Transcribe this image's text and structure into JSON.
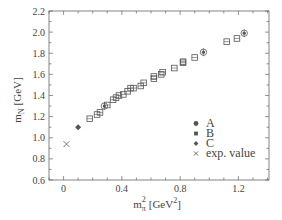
{
  "chart_data": {
    "type": "scatter",
    "title": "",
    "xlabel": "m_π² [GeV²]",
    "ylabel": "m_N [GeV]",
    "xlim": [
      -0.1,
      1.41
    ],
    "ylim": [
      0.6,
      2.2
    ],
    "x_ticks_major": [
      0,
      0.4,
      0.8,
      1.2
    ],
    "x_tick_labels": [
      "0",
      "0.4",
      "0.8",
      "1.2"
    ],
    "x_tick_minor_step": 0.1,
    "y_ticks_major": [
      0.6,
      0.8,
      1.0,
      1.2,
      1.4,
      1.6,
      1.8,
      2.0,
      2.2
    ],
    "y_tick_labels": [
      "0.6",
      "0.8",
      "1.0",
      "1.2",
      "1.4",
      "1.6",
      "1.8",
      "2.0",
      "2.2"
    ],
    "y_tick_minor_step": 0.1,
    "grid": false,
    "legend_position": "lower right",
    "series": [
      {
        "name": "A",
        "marker": "circle",
        "points": [
          [
            0.28,
            1.3
          ],
          [
            0.96,
            1.81
          ],
          [
            1.24,
            1.99
          ]
        ]
      },
      {
        "name": "B",
        "marker": "square",
        "points": [
          [
            0.18,
            1.18
          ],
          [
            0.23,
            1.22
          ],
          [
            0.25,
            1.24
          ],
          [
            0.3,
            1.31
          ],
          [
            0.34,
            1.36
          ],
          [
            0.36,
            1.38
          ],
          [
            0.38,
            1.4
          ],
          [
            0.41,
            1.41
          ],
          [
            0.44,
            1.44
          ],
          [
            0.46,
            1.47
          ],
          [
            0.48,
            1.47
          ],
          [
            0.53,
            1.49
          ],
          [
            0.55,
            1.52
          ],
          [
            0.62,
            1.58
          ],
          [
            0.62,
            1.56
          ],
          [
            0.67,
            1.6
          ],
          [
            0.68,
            1.62
          ],
          [
            0.76,
            1.66
          ],
          [
            0.82,
            1.72
          ],
          [
            0.82,
            1.71
          ],
          [
            0.9,
            1.76
          ],
          [
            1.12,
            1.91
          ],
          [
            1.19,
            1.94
          ]
        ]
      },
      {
        "name": "C",
        "marker": "diamond",
        "points": [
          [
            0.1,
            1.1
          ]
        ]
      },
      {
        "name": "exp. value",
        "marker": "x",
        "points": [
          [
            0.02,
            0.94
          ]
        ]
      }
    ]
  },
  "labels": {
    "ylabel_main": "m",
    "ylabel_sub": "N",
    "ylabel_unit": "[GeV]",
    "xlabel_main": "m",
    "xlabel_sub": "π",
    "xlabel_sup": "2",
    "xlabel_unit": "[GeV",
    "xlabel_unit_sup": "2",
    "xlabel_close": "]"
  },
  "legend": {
    "items": [
      {
        "label": "A",
        "marker": "circle"
      },
      {
        "label": "B",
        "marker": "square"
      },
      {
        "label": "C",
        "marker": "diamond"
      },
      {
        "label": "exp. value",
        "marker": "x"
      }
    ]
  },
  "colors": {
    "axis": "#666666",
    "marker": "#555555",
    "text": "#444444"
  }
}
